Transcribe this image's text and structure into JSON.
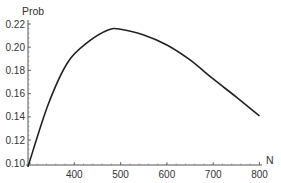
{
  "chart_data": {
    "type": "line",
    "title": "",
    "xlabel": "N",
    "ylabel": "Prob",
    "xlim": [
      300,
      810
    ],
    "ylim": [
      0.0975,
      0.222
    ],
    "x_ticks": [
      400,
      500,
      600,
      700,
      800
    ],
    "x_tick_labels": [
      "400",
      "500",
      "600",
      "700",
      "800"
    ],
    "y_ticks": [
      0.1,
      0.12,
      0.14,
      0.16,
      0.18,
      0.2,
      0.22
    ],
    "y_tick_labels": [
      "0.10",
      "0.12",
      "0.14",
      "0.16",
      "0.18",
      "0.20",
      "0.22"
    ],
    "grid": false,
    "legend": null,
    "series": [
      {
        "name": "Prob",
        "color": "#222222",
        "x": [
          300,
          343,
          386,
          430,
          473,
          500,
          550,
          600,
          650,
          700,
          750,
          800
        ],
        "y": [
          0.097,
          0.15,
          0.187,
          0.2045,
          0.2148,
          0.2155,
          0.2105,
          0.2019,
          0.189,
          0.1726,
          0.157,
          0.1407
        ]
      }
    ]
  }
}
